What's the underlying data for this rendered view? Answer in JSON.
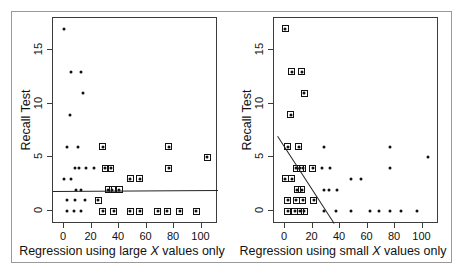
{
  "figure": {
    "background": "#ffffff",
    "frame_color": "#9a9a9a",
    "point_color": "#111111",
    "axis_color": "#3c3c3c"
  },
  "chart_data": [
    {
      "type": "scatter",
      "panel": "left",
      "title": "",
      "xlabel": "Regression using large X values only",
      "ylabel": "Recall Test",
      "xlim": [
        -8,
        112
      ],
      "ylim": [
        -1.2,
        18
      ],
      "grid": false,
      "legend": "none",
      "xticks": [
        0,
        20,
        40,
        60,
        80,
        100
      ],
      "xticklabels": [
        "0",
        "20",
        "40",
        "60",
        "80",
        "100"
      ],
      "yticks": [
        0,
        5,
        10,
        15
      ],
      "yticklabels": [
        "0",
        "5",
        "10",
        "15"
      ],
      "points": [
        {
          "x": 0,
          "y": 17,
          "highlight": false
        },
        {
          "x": 5,
          "y": 13,
          "highlight": false
        },
        {
          "x": 12,
          "y": 13,
          "highlight": false
        },
        {
          "x": 14,
          "y": 11,
          "highlight": false
        },
        {
          "x": 4,
          "y": 9,
          "highlight": false
        },
        {
          "x": 2,
          "y": 6,
          "highlight": false
        },
        {
          "x": 10,
          "y": 6,
          "highlight": false
        },
        {
          "x": 28,
          "y": 6,
          "highlight": true
        },
        {
          "x": 76,
          "y": 6,
          "highlight": true
        },
        {
          "x": 104,
          "y": 5,
          "highlight": true
        },
        {
          "x": 8,
          "y": 4,
          "highlight": false
        },
        {
          "x": 11,
          "y": 4,
          "highlight": false
        },
        {
          "x": 16,
          "y": 4,
          "highlight": false
        },
        {
          "x": 22,
          "y": 4,
          "highlight": false
        },
        {
          "x": 30,
          "y": 4,
          "highlight": true
        },
        {
          "x": 34,
          "y": 4,
          "highlight": true
        },
        {
          "x": 76,
          "y": 4,
          "highlight": true
        },
        {
          "x": 0,
          "y": 3,
          "highlight": false
        },
        {
          "x": 5,
          "y": 3,
          "highlight": false
        },
        {
          "x": 48,
          "y": 3,
          "highlight": true
        },
        {
          "x": 55,
          "y": 3,
          "highlight": true
        },
        {
          "x": 9,
          "y": 2,
          "highlight": false
        },
        {
          "x": 12,
          "y": 2,
          "highlight": false
        },
        {
          "x": 32,
          "y": 2,
          "highlight": true
        },
        {
          "x": 35,
          "y": 2,
          "highlight": true
        },
        {
          "x": 40,
          "y": 2,
          "highlight": true
        },
        {
          "x": 2,
          "y": 1,
          "highlight": false
        },
        {
          "x": 8,
          "y": 1,
          "highlight": false
        },
        {
          "x": 15,
          "y": 1,
          "highlight": false
        },
        {
          "x": 25,
          "y": 1,
          "highlight": true
        },
        {
          "x": 2,
          "y": 0,
          "highlight": false
        },
        {
          "x": 7,
          "y": 0,
          "highlight": false
        },
        {
          "x": 12,
          "y": 0,
          "highlight": false
        },
        {
          "x": 28,
          "y": 0,
          "highlight": true
        },
        {
          "x": 36,
          "y": 0,
          "highlight": true
        },
        {
          "x": 48,
          "y": 0,
          "highlight": true
        },
        {
          "x": 55,
          "y": 0,
          "highlight": true
        },
        {
          "x": 68,
          "y": 0,
          "highlight": true
        },
        {
          "x": 75,
          "y": 0,
          "highlight": true
        },
        {
          "x": 84,
          "y": 0,
          "highlight": true
        },
        {
          "x": 96,
          "y": 0,
          "highlight": true
        }
      ],
      "regression_line": {
        "x1": -8,
        "y1": 1.92,
        "x2": 112,
        "y2": 2.02
      }
    },
    {
      "type": "scatter",
      "panel": "right",
      "title": "",
      "xlabel": "Regression using small X values only",
      "ylabel": "Recall Test",
      "xlim": [
        -8,
        112
      ],
      "ylim": [
        -1.2,
        18
      ],
      "grid": false,
      "legend": "none",
      "xticks": [
        0,
        20,
        40,
        60,
        80,
        100
      ],
      "xticklabels": [
        "0",
        "20",
        "40",
        "60",
        "80",
        "100"
      ],
      "yticks": [
        0,
        5,
        10,
        15
      ],
      "yticklabels": [
        "0",
        "5",
        "10",
        "15"
      ],
      "points": [
        {
          "x": 0,
          "y": 17,
          "highlight": true
        },
        {
          "x": 5,
          "y": 13,
          "highlight": true
        },
        {
          "x": 12,
          "y": 13,
          "highlight": true
        },
        {
          "x": 14,
          "y": 11,
          "highlight": true
        },
        {
          "x": 4,
          "y": 9,
          "highlight": true
        },
        {
          "x": 2,
          "y": 6,
          "highlight": true
        },
        {
          "x": 10,
          "y": 6,
          "highlight": true
        },
        {
          "x": 28,
          "y": 6,
          "highlight": false
        },
        {
          "x": 76,
          "y": 6,
          "highlight": false
        },
        {
          "x": 104,
          "y": 5,
          "highlight": false
        },
        {
          "x": 8,
          "y": 4,
          "highlight": true
        },
        {
          "x": 11,
          "y": 4,
          "highlight": true
        },
        {
          "x": 13,
          "y": 4,
          "highlight": true
        },
        {
          "x": 20,
          "y": 4,
          "highlight": true
        },
        {
          "x": 27,
          "y": 4,
          "highlight": false
        },
        {
          "x": 33,
          "y": 4,
          "highlight": false
        },
        {
          "x": 76,
          "y": 4,
          "highlight": false
        },
        {
          "x": 0,
          "y": 3,
          "highlight": true
        },
        {
          "x": 5,
          "y": 3,
          "highlight": true
        },
        {
          "x": 48,
          "y": 3,
          "highlight": false
        },
        {
          "x": 55,
          "y": 3,
          "highlight": false
        },
        {
          "x": 9,
          "y": 2,
          "highlight": true
        },
        {
          "x": 12,
          "y": 2,
          "highlight": true
        },
        {
          "x": 28,
          "y": 2,
          "highlight": false
        },
        {
          "x": 32,
          "y": 2,
          "highlight": false
        },
        {
          "x": 38,
          "y": 2,
          "highlight": false
        },
        {
          "x": 2,
          "y": 1,
          "highlight": true
        },
        {
          "x": 8,
          "y": 1,
          "highlight": true
        },
        {
          "x": 13,
          "y": 1,
          "highlight": true
        },
        {
          "x": 21,
          "y": 1,
          "highlight": true
        },
        {
          "x": 2,
          "y": 0,
          "highlight": true
        },
        {
          "x": 7,
          "y": 0,
          "highlight": true
        },
        {
          "x": 11,
          "y": 0,
          "highlight": true
        },
        {
          "x": 14,
          "y": 0,
          "highlight": true
        },
        {
          "x": 28,
          "y": 0,
          "highlight": false
        },
        {
          "x": 37,
          "y": 0,
          "highlight": false
        },
        {
          "x": 48,
          "y": 0,
          "highlight": false
        },
        {
          "x": 62,
          "y": 0,
          "highlight": false
        },
        {
          "x": 68,
          "y": 0,
          "highlight": false
        },
        {
          "x": 76,
          "y": 0,
          "highlight": false
        },
        {
          "x": 84,
          "y": 0,
          "highlight": false
        },
        {
          "x": 96,
          "y": 0,
          "highlight": false
        }
      ],
      "regression_line": {
        "x1": -5,
        "y1": 7.0,
        "x2": 36,
        "y2": -1.1
      }
    }
  ]
}
